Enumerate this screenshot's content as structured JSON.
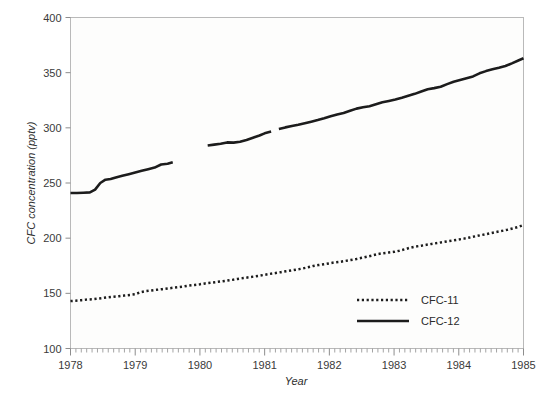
{
  "chart_data": {
    "type": "line",
    "title": "",
    "xlabel": "Year",
    "ylabel": "CFC concentration (pptv)",
    "xlim": [
      1978,
      1985
    ],
    "ylim": [
      100,
      400
    ],
    "xticks": [
      1978,
      1979,
      1980,
      1981,
      1982,
      1983,
      1984,
      1985
    ],
    "xtick_labels": [
      "1978",
      "1979",
      "1980",
      "1981",
      "1982",
      "1983",
      "1984",
      "1985"
    ],
    "yticks": [
      100,
      150,
      200,
      250,
      300,
      350,
      400
    ],
    "ytick_labels": [
      "100",
      "150",
      "200",
      "250",
      "300",
      "350",
      "400"
    ],
    "minor_xticks_per_year": 12,
    "grid": false,
    "legend_position": "lower-right-inside",
    "series": [
      {
        "name": "CFC-11",
        "style": "dotted",
        "color": "#1c1c1c",
        "x": [
          1978.0,
          1978.08,
          1978.17,
          1978.25,
          1978.33,
          1978.42,
          1978.5,
          1978.58,
          1978.67,
          1978.75,
          1978.83,
          1978.92,
          1979.0,
          1979.08,
          1979.17,
          1979.25,
          1979.33,
          1979.42,
          1979.5,
          1979.58,
          1979.67,
          1979.75,
          1979.83,
          1979.92,
          1980.0,
          1980.08,
          1980.17,
          1980.25,
          1980.33,
          1980.42,
          1980.5,
          1980.58,
          1980.67,
          1980.75,
          1980.83,
          1980.92,
          1981.0,
          1981.08,
          1981.17,
          1981.25,
          1981.33,
          1981.42,
          1981.5,
          1981.58,
          1981.67,
          1981.75,
          1981.83,
          1981.92,
          1982.0,
          1982.08,
          1982.17,
          1982.25,
          1982.33,
          1982.42,
          1982.5,
          1982.58,
          1982.67,
          1982.75,
          1982.83,
          1982.92,
          1983.0,
          1983.08,
          1983.17,
          1983.25,
          1983.33,
          1983.42,
          1983.5,
          1983.58,
          1983.67,
          1983.75,
          1983.83,
          1983.92,
          1984.0,
          1984.08,
          1984.17,
          1984.25,
          1984.33,
          1984.42,
          1984.5,
          1984.58,
          1984.67,
          1984.75,
          1984.83,
          1984.92,
          1985.0
        ],
        "y": [
          143.0,
          143.3,
          143.8,
          144.3,
          144.6,
          145.2,
          145.8,
          146.4,
          147.0,
          147.4,
          148.0,
          148.6,
          149.2,
          151.0,
          152.0,
          152.6,
          153.2,
          153.8,
          154.4,
          155.0,
          155.6,
          156.2,
          157.0,
          157.6,
          158.2,
          159.0,
          159.6,
          160.2,
          160.8,
          161.5,
          162.2,
          163.0,
          163.8,
          164.5,
          165.2,
          166.0,
          166.8,
          167.6,
          168.4,
          169.2,
          170.0,
          170.8,
          171.6,
          172.4,
          173.6,
          174.8,
          175.6,
          176.4,
          177.2,
          178.0,
          178.6,
          179.4,
          180.2,
          181.2,
          182.2,
          183.2,
          184.4,
          185.6,
          186.4,
          187.0,
          187.6,
          188.6,
          190.0,
          191.4,
          192.4,
          193.2,
          194.0,
          194.8,
          195.6,
          196.4,
          197.2,
          198.0,
          198.8,
          199.6,
          200.6,
          201.6,
          202.6,
          203.6,
          204.6,
          205.6,
          206.6,
          207.6,
          208.8,
          210.2,
          212.0
        ]
      },
      {
        "name": "CFC-12",
        "style": "solid",
        "color": "#1c1c1c",
        "gaps": [
          [
            1979.58,
            1980.12
          ],
          [
            1981.1,
            1981.22
          ]
        ],
        "x": [
          1978.0,
          1978.1,
          1978.2,
          1978.3,
          1978.38,
          1978.46,
          1978.54,
          1978.62,
          1978.7,
          1978.8,
          1978.9,
          1979.0,
          1979.1,
          1979.2,
          1979.3,
          1979.4,
          1979.5,
          1979.58,
          1980.12,
          1980.22,
          1980.32,
          1980.42,
          1980.52,
          1980.62,
          1980.72,
          1980.82,
          1980.92,
          1981.0,
          1981.1,
          1981.22,
          1981.32,
          1981.42,
          1981.52,
          1981.62,
          1981.72,
          1981.82,
          1981.92,
          1982.02,
          1982.12,
          1982.22,
          1982.32,
          1982.42,
          1982.52,
          1982.62,
          1982.72,
          1982.82,
          1982.92,
          1983.02,
          1983.12,
          1983.22,
          1983.32,
          1983.42,
          1983.52,
          1983.62,
          1983.72,
          1983.82,
          1983.92,
          1984.02,
          1984.12,
          1984.22,
          1984.32,
          1984.42,
          1984.52,
          1984.62,
          1984.72,
          1984.82,
          1984.92,
          1985.0
        ],
        "y": [
          241.0,
          241.0,
          241.2,
          241.5,
          244.0,
          250.0,
          253.0,
          253.6,
          255.0,
          256.5,
          258.0,
          259.5,
          261.0,
          262.5,
          264.0,
          266.8,
          267.4,
          268.8,
          284.0,
          284.8,
          285.6,
          286.8,
          286.6,
          287.4,
          289.0,
          291.0,
          293.0,
          295.0,
          296.6,
          299.0,
          300.4,
          301.6,
          302.8,
          304.2,
          305.6,
          307.0,
          308.6,
          310.4,
          312.0,
          313.4,
          315.4,
          317.4,
          318.6,
          319.6,
          321.4,
          323.2,
          324.4,
          325.6,
          327.2,
          329.0,
          330.8,
          333.0,
          335.0,
          336.0,
          337.2,
          339.6,
          341.8,
          343.4,
          345.0,
          346.6,
          349.4,
          351.4,
          353.0,
          354.4,
          356.0,
          358.4,
          361.0,
          363.0
        ]
      }
    ],
    "legend": [
      {
        "label": "CFC-11",
        "style": "dotted"
      },
      {
        "label": "CFC-12",
        "style": "solid"
      }
    ]
  }
}
